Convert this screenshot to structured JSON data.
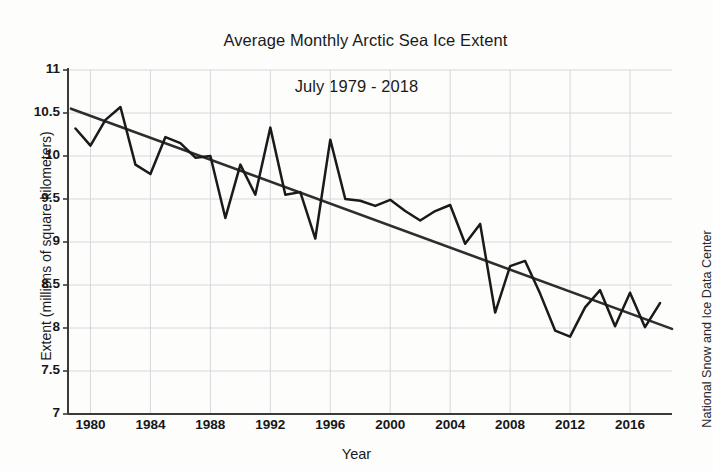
{
  "chart_data": {
    "type": "line",
    "title": "Average Monthly Arctic Sea Ice Extent",
    "subtitle": "July 1979 - 2018",
    "xlabel": "Year",
    "ylabel": "Extent (millions of square kilometers)",
    "credit": "National Snow and Ice Data Center",
    "xlim": [
      1978.5,
      2018.8
    ],
    "ylim": [
      7,
      11
    ],
    "ytick_labels": [
      "11",
      "10.5",
      "10",
      "9.5",
      "9",
      "8.5",
      "8",
      "7.5",
      "7"
    ],
    "yticks": [
      11,
      10.5,
      10,
      9.5,
      9,
      8.5,
      8,
      7.5,
      7
    ],
    "xtick_labels": [
      "1980",
      "1984",
      "1988",
      "1992",
      "1996",
      "2000",
      "2004",
      "2008",
      "2012",
      "2016"
    ],
    "xticks": [
      1980,
      1984,
      1988,
      1992,
      1996,
      2000,
      2004,
      2008,
      2012,
      2016
    ],
    "grid": true,
    "legend": null,
    "series": [
      {
        "name": "July Arctic sea ice extent",
        "color": "#1a1a1a",
        "x": [
          1979,
          1980,
          1981,
          1982,
          1983,
          1984,
          1985,
          1986,
          1987,
          1988,
          1989,
          1990,
          1991,
          1992,
          1993,
          1994,
          1995,
          1996,
          1997,
          1998,
          1999,
          2000,
          2001,
          2002,
          2003,
          2004,
          2005,
          2006,
          2007,
          2008,
          2009,
          2010,
          2011,
          2012,
          2013,
          2014,
          2015,
          2016,
          2017,
          2018
        ],
        "values": [
          10.32,
          10.12,
          10.42,
          10.57,
          9.9,
          9.79,
          10.22,
          10.15,
          9.98,
          10.0,
          9.28,
          9.9,
          9.55,
          10.33,
          9.55,
          9.58,
          9.04,
          10.19,
          9.5,
          9.48,
          9.42,
          9.49,
          9.36,
          9.25,
          9.36,
          9.43,
          8.98,
          9.21,
          8.18,
          8.72,
          8.78,
          8.4,
          7.97,
          7.9,
          8.24,
          8.44,
          8.02,
          8.41,
          8.01,
          8.29
        ]
      }
    ],
    "trendline": {
      "name": "Linear trend",
      "color": "#2e2e2e",
      "x": [
        1978.7,
        2018.8
      ],
      "values": [
        10.55,
        7.99
      ]
    }
  }
}
